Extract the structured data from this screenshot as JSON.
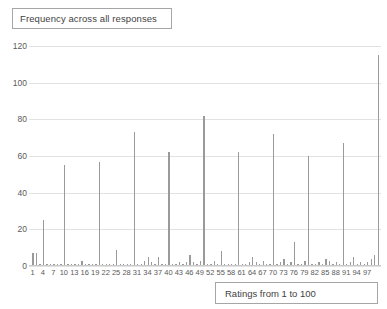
{
  "chart_data": {
    "type": "bar",
    "title": "Frequency across all responses",
    "xlabel": "Ratings from 1 to 100",
    "ylabel": "",
    "xlim": [
      0,
      101
    ],
    "ylim": [
      0,
      120
    ],
    "ytick_step": 20,
    "yticks": [
      0,
      20,
      40,
      60,
      80,
      100,
      120
    ],
    "xticks": [
      1,
      4,
      7,
      10,
      13,
      16,
      19,
      22,
      25,
      28,
      31,
      34,
      37,
      40,
      43,
      46,
      49,
      52,
      55,
      58,
      61,
      64,
      67,
      70,
      73,
      76,
      79,
      82,
      85,
      88,
      91,
      94,
      97
    ],
    "xtick_step": 3,
    "grid": "horizontal",
    "legend": "none",
    "bar_color": "#9a9a9a",
    "categories": [
      1,
      2,
      3,
      4,
      5,
      6,
      7,
      8,
      9,
      10,
      11,
      12,
      13,
      14,
      15,
      16,
      17,
      18,
      19,
      20,
      21,
      22,
      23,
      24,
      25,
      26,
      27,
      28,
      29,
      30,
      31,
      32,
      33,
      34,
      35,
      36,
      37,
      38,
      39,
      40,
      41,
      42,
      43,
      44,
      45,
      46,
      47,
      48,
      49,
      50,
      51,
      52,
      53,
      54,
      55,
      56,
      57,
      58,
      59,
      60,
      61,
      62,
      63,
      64,
      65,
      66,
      67,
      68,
      69,
      70,
      71,
      72,
      73,
      74,
      75,
      76,
      77,
      78,
      79,
      80,
      81,
      82,
      83,
      84,
      85,
      86,
      87,
      88,
      89,
      90,
      91,
      92,
      93,
      94,
      95,
      96,
      97,
      98,
      99,
      100
    ],
    "values": [
      7,
      7,
      1,
      25,
      1,
      1,
      1,
      1,
      1,
      55,
      1,
      1,
      1,
      1,
      3,
      1,
      1,
      1,
      1,
      57,
      1,
      1,
      1,
      1,
      9,
      1,
      1,
      1,
      1,
      73,
      1,
      1,
      3,
      5,
      2,
      1,
      5,
      1,
      1,
      62,
      1,
      1,
      2,
      1,
      2,
      6,
      2,
      1,
      3,
      82,
      1,
      1,
      3,
      1,
      8,
      1,
      1,
      1,
      1,
      62,
      1,
      1,
      2,
      5,
      2,
      1,
      3,
      1,
      1,
      72,
      1,
      2,
      4,
      1,
      2,
      13,
      1,
      1,
      3,
      60,
      1,
      1,
      2,
      1,
      4,
      3,
      1,
      2,
      1,
      67,
      1,
      2,
      5,
      1,
      2,
      1,
      2,
      4,
      6,
      115
    ]
  },
  "title_box": {
    "label": "Frequency across all responses"
  },
  "xaxis_title_box": {
    "label": "Ratings from 1 to 100"
  }
}
